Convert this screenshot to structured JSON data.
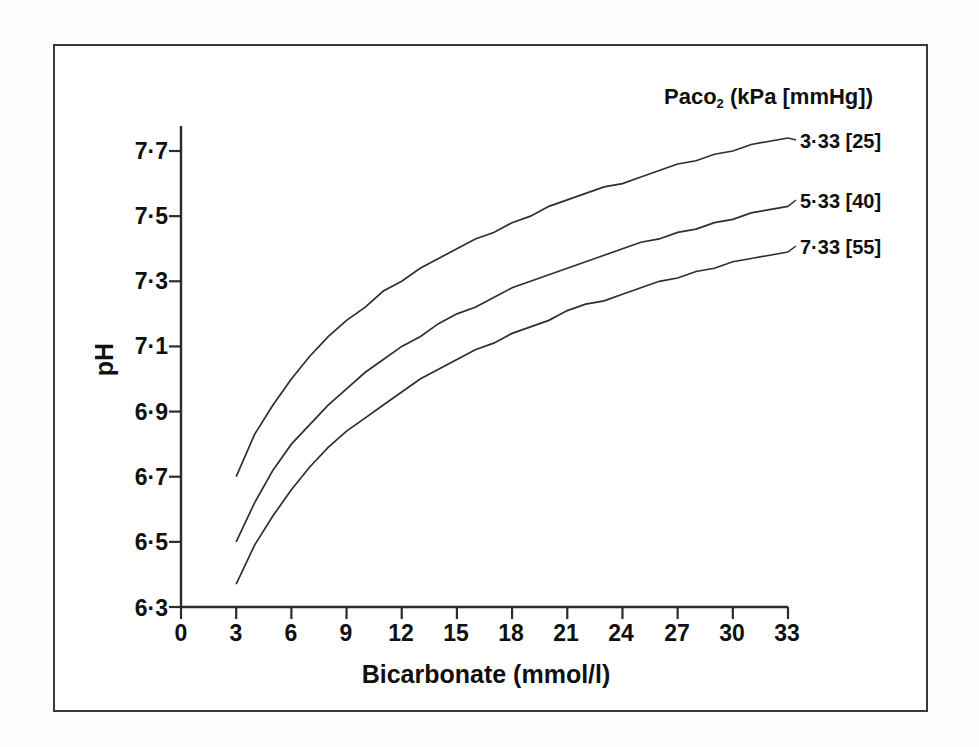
{
  "figure": {
    "y_axis_label": "pH",
    "x_axis_label": "Bicarbonate (mmol/l)",
    "legend_title_main": "Paco",
    "legend_title_sub": "2",
    "legend_title_rest": " (kPa [mmHg])"
  },
  "axes": {
    "x_ticks": [
      "0",
      "3",
      "6",
      "9",
      "12",
      "15",
      "18",
      "21",
      "24",
      "27",
      "30",
      "33"
    ],
    "y_ticks": [
      "7·7",
      "7·5",
      "7·3",
      "7·1",
      "6·9",
      "6·7",
      "6·5",
      "6·3"
    ]
  },
  "legend": {
    "entries": [
      {
        "label": "3·33 [25]"
      },
      {
        "label": "5·33 [40]"
      },
      {
        "label": "7·33 [55]"
      }
    ]
  },
  "chart_data": {
    "type": "line",
    "title": "",
    "xlabel": "Bicarbonate (mmol/l)",
    "ylabel": "pH",
    "xlim": [
      0,
      33
    ],
    "ylim": [
      6.3,
      7.7
    ],
    "grid": false,
    "legend_position": "right",
    "legend_title": "Paco2 (kPa [mmHg])",
    "x_tick_values": [
      0,
      3,
      6,
      9,
      12,
      15,
      18,
      21,
      24,
      27,
      30,
      33
    ],
    "y_tick_values": [
      6.3,
      6.5,
      6.7,
      6.9,
      7.1,
      7.3,
      7.5,
      7.7
    ],
    "x": [
      3,
      4,
      5,
      6,
      7,
      8,
      9,
      10,
      11,
      12,
      13,
      14,
      15,
      16,
      17,
      18,
      19,
      20,
      21,
      22,
      23,
      24,
      25,
      26,
      27,
      28,
      29,
      30,
      31,
      32,
      33
    ],
    "series": [
      {
        "name": "3·33 [25]",
        "paco2_kpa": 3.33,
        "paco2_mmhg": 25,
        "values": [
          6.7,
          6.83,
          6.92,
          7.0,
          7.07,
          7.13,
          7.18,
          7.22,
          7.27,
          7.3,
          7.34,
          7.37,
          7.4,
          7.43,
          7.45,
          7.48,
          7.5,
          7.53,
          7.55,
          7.57,
          7.59,
          7.6,
          7.62,
          7.64,
          7.66,
          7.67,
          7.69,
          7.7,
          7.72,
          7.73,
          7.74
        ]
      },
      {
        "name": "5·33 [40]",
        "paco2_kpa": 5.33,
        "paco2_mmhg": 40,
        "values": [
          6.5,
          6.62,
          6.72,
          6.8,
          6.86,
          6.92,
          6.97,
          7.02,
          7.06,
          7.1,
          7.13,
          7.17,
          7.2,
          7.22,
          7.25,
          7.28,
          7.3,
          7.32,
          7.34,
          7.36,
          7.38,
          7.4,
          7.42,
          7.43,
          7.45,
          7.46,
          7.48,
          7.49,
          7.51,
          7.52,
          7.53
        ]
      },
      {
        "name": "7·33 [55]",
        "paco2_kpa": 7.33,
        "paco2_mmhg": 55,
        "values": [
          6.37,
          6.49,
          6.58,
          6.66,
          6.73,
          6.79,
          6.84,
          6.88,
          6.92,
          6.96,
          7.0,
          7.03,
          7.06,
          7.09,
          7.11,
          7.14,
          7.16,
          7.18,
          7.21,
          7.23,
          7.24,
          7.26,
          7.28,
          7.3,
          7.31,
          7.33,
          7.34,
          7.36,
          7.37,
          7.38,
          7.39
        ]
      }
    ]
  }
}
